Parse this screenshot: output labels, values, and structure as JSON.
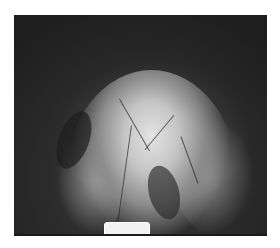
{
  "image": {
    "type": "endoscopic grayscale photograph",
    "background_color": "#ffffff",
    "frame_color": "#2e2e2e",
    "overlay_text_top_right": "",
    "overlay_text_left": ""
  }
}
